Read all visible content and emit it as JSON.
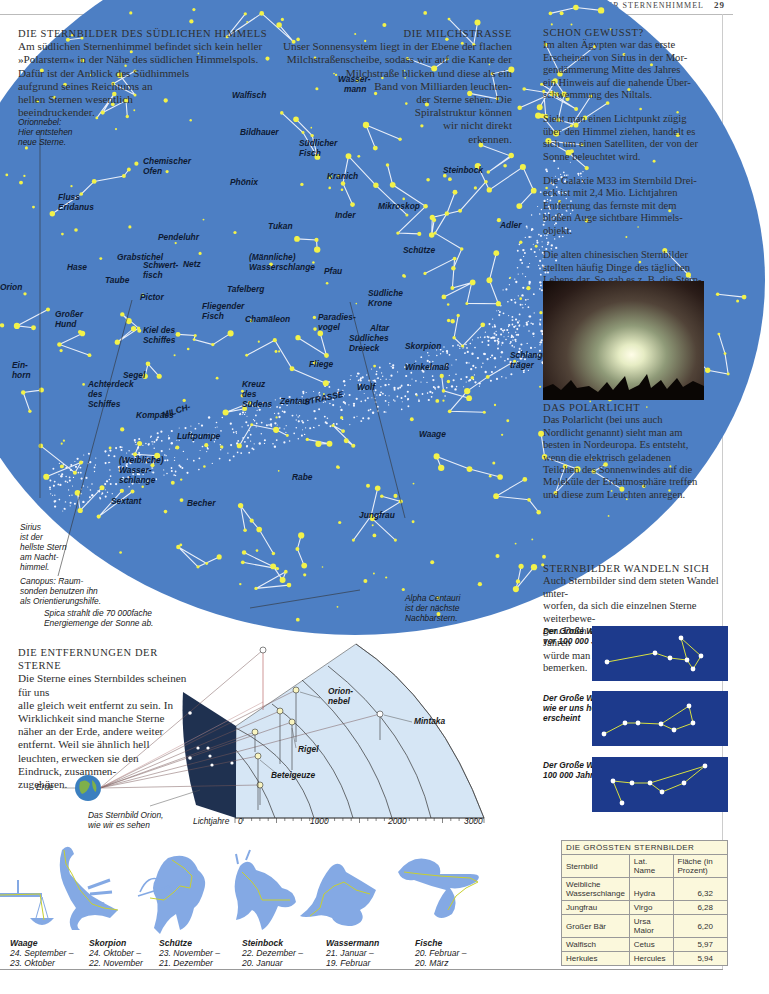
{
  "page_header": {
    "section": "DER STERNENHIMMEL",
    "page_number": "29"
  },
  "southern_sky": {
    "title": "DIE STERNBILDER DES SÜDLICHEN HIMMELS",
    "lines": [
      "Am südlichen Sternenhimmel befindet sich kein heller",
      "»Polarstern« in der Nähe des südlichen Himmelspols.",
      "Dafür ist der Anblick des Südhimmels",
      "aufgrund seines Reichtums an",
      "hellen Sternen wesentlich",
      "beeindruckender."
    ]
  },
  "milky_way": {
    "title": "DIE MILCHSTRASSE",
    "lines": [
      "Unser Sonnensystem liegt in der Ebene der flachen",
      "Milchstraßenscheibe, sodass wir auf die Kante der",
      "Milchstraße blicken und diese als ein",
      "Band von Milliarden leuchten-",
      "der Sterne sehen. Die",
      "Spiralstruktur können",
      "wir nicht direkt",
      "erkennen."
    ]
  },
  "did_you_know": {
    "title": "SCHON GEWUSST?",
    "paragraphs": [
      [
        "Im alten Ägypten war das erste",
        "Erscheinen von Sirius in der Mor-",
        "gendämmerung Mitte des Jahres",
        "ein Hinweis auf die nahende Über-",
        "schwemmung des Niltals."
      ],
      [
        "Sieht man einen Lichtpunkt zügig",
        "über den Himmel ziehen, handelt es",
        "sich um einen Satelliten, der von der",
        "Sonne beleuchtet wird."
      ],
      [
        "Die Galaxie M33 im Sternbild Drei-",
        "eck ist mit 2,4 Mio. Lichtjahren",
        "Entfernung das fernste mit dem",
        "bloßen Auge sichtbare Himmels-",
        "objekt."
      ],
      [
        "Die alten chinesischen Sternbilder",
        "stellten häufig Dinge des täglichen",
        "Lebens dar. So gab es z. B. die Stern-",
        "bilder »Gefängnis« und »Stall«."
      ]
    ]
  },
  "aurora": {
    "title": "DAS POLARLICHT",
    "lines": [
      "Das Polarlicht (bei uns auch",
      "Nordlicht genannt) sieht man am",
      "besten in Nordeuropa. Es entsteht,",
      "wenn die elektrisch geladenen",
      "Teilchen des Sonnenwindes auf die",
      "Moleküle der Erdatmosphäre treffen",
      "und diese zum Leuchten anregen."
    ]
  },
  "sky_captions": {
    "orion_nebula": [
      "Orionnebel:",
      "Hier entstehen",
      "neue Sterne."
    ],
    "sirius": [
      "Sirius",
      "ist der",
      "hellste Stern",
      "am Nacht-",
      "himmel."
    ],
    "canopus": [
      "Canopus: Raum-",
      "sonden benutzen ihn",
      "als Orientierungshilfe."
    ],
    "spica": [
      "Spica strahlt die 70 000fache",
      "Energiemenge der Sonne ab."
    ],
    "alpha_centauri": [
      "Alpha Centauri",
      "ist der nächste",
      "Nachbarstern."
    ]
  },
  "constellations": [
    {
      "name": "Walfisch",
      "x": 292,
      "y": 208
    },
    {
      "name": "Wasser-",
      "x": 398,
      "y": 192
    },
    {
      "name": "mann",
      "x": 404,
      "y": 202
    },
    {
      "name": "Bildhauer",
      "x": 300,
      "y": 245
    },
    {
      "name": "Südlicher",
      "x": 359,
      "y": 256
    },
    {
      "name": "Fisch",
      "x": 359,
      "y": 266
    },
    {
      "name": "Chemischer",
      "x": 203,
      "y": 274
    },
    {
      "name": "Ofen",
      "x": 203,
      "y": 284
    },
    {
      "name": "Phönix",
      "x": 290,
      "y": 295
    },
    {
      "name": "Kranich",
      "x": 387,
      "y": 289
    },
    {
      "name": "Steinbock",
      "x": 503,
      "y": 283
    },
    {
      "name": "Fluss",
      "x": 118,
      "y": 310
    },
    {
      "name": "Eridanus",
      "x": 118,
      "y": 320
    },
    {
      "name": "Mikroskop",
      "x": 438,
      "y": 319
    },
    {
      "name": "Inder",
      "x": 395,
      "y": 328
    },
    {
      "name": "Tukan",
      "x": 328,
      "y": 339
    },
    {
      "name": "Adler",
      "x": 560,
      "y": 338
    },
    {
      "name": "Pendeluhr",
      "x": 218,
      "y": 350
    },
    {
      "name": "(Männliche)",
      "x": 309,
      "y": 370
    },
    {
      "name": "Wasserschlange",
      "x": 309,
      "y": 380
    },
    {
      "name": "Schütze",
      "x": 463,
      "y": 363
    },
    {
      "name": "Grabstichel",
      "x": 177,
      "y": 370
    },
    {
      "name": "Netz",
      "x": 243,
      "y": 377
    },
    {
      "name": "Pfau",
      "x": 384,
      "y": 384
    },
    {
      "name": "Schwert-",
      "x": 203,
      "y": 378
    },
    {
      "name": "fisch",
      "x": 203,
      "y": 388
    },
    {
      "name": "Hase",
      "x": 127,
      "y": 380
    },
    {
      "name": "Taube",
      "x": 165,
      "y": 393
    },
    {
      "name": "Südliche",
      "x": 428,
      "y": 406
    },
    {
      "name": "Krone",
      "x": 428,
      "y": 416
    },
    {
      "name": "Tafelberg",
      "x": 287,
      "y": 402
    },
    {
      "name": "Orion",
      "x": 60,
      "y": 400
    },
    {
      "name": "Pictor",
      "x": 200,
      "y": 410
    },
    {
      "name": "Fliegender",
      "x": 262,
      "y": 419
    },
    {
      "name": "Fisch",
      "x": 262,
      "y": 429
    },
    {
      "name": "Chamäleon",
      "x": 305,
      "y": 432
    },
    {
      "name": "Paradies-",
      "x": 378,
      "y": 430
    },
    {
      "name": "vogel",
      "x": 378,
      "y": 440
    },
    {
      "name": "Altar",
      "x": 430,
      "y": 441
    },
    {
      "name": "Großer",
      "x": 115,
      "y": 427
    },
    {
      "name": "Hund",
      "x": 115,
      "y": 437
    },
    {
      "name": "Südliches",
      "x": 409,
      "y": 451
    },
    {
      "name": "Dreieck",
      "x": 409,
      "y": 461
    },
    {
      "name": "Skorpion",
      "x": 465,
      "y": 459
    },
    {
      "name": "Schlangen-",
      "x": 570,
      "y": 468
    },
    {
      "name": "träger",
      "x": 570,
      "y": 478
    },
    {
      "name": "Kiel des",
      "x": 203,
      "y": 443
    },
    {
      "name": "Schiffes",
      "x": 203,
      "y": 453
    },
    {
      "name": "Ein-",
      "x": 72,
      "y": 478
    },
    {
      "name": "horn",
      "x": 72,
      "y": 488
    },
    {
      "name": "Fliege",
      "x": 369,
      "y": 477
    },
    {
      "name": "Winkelmaß",
      "x": 465,
      "y": 480
    },
    {
      "name": "Segel",
      "x": 183,
      "y": 488
    },
    {
      "name": "Achterdeck",
      "x": 148,
      "y": 497
    },
    {
      "name": "des",
      "x": 148,
      "y": 507
    },
    {
      "name": "Schiffes",
      "x": 148,
      "y": 517
    },
    {
      "name": "Kreuz",
      "x": 302,
      "y": 497
    },
    {
      "name": "des",
      "x": 302,
      "y": 507
    },
    {
      "name": "Südens",
      "x": 302,
      "y": 517
    },
    {
      "name": "Wolf",
      "x": 417,
      "y": 500
    },
    {
      "name": "Zentaur",
      "x": 340,
      "y": 514
    },
    {
      "name": "Kompass",
      "x": 196,
      "y": 528
    },
    {
      "name": "Luftpumpe",
      "x": 237,
      "y": 549
    },
    {
      "name": "Waage",
      "x": 479,
      "y": 547
    },
    {
      "name": "(Weibliche)",
      "x": 179,
      "y": 573
    },
    {
      "name": "Wasser-",
      "x": 179,
      "y": 583
    },
    {
      "name": "schlange",
      "x": 179,
      "y": 593
    },
    {
      "name": "Rabe",
      "x": 352,
      "y": 590
    },
    {
      "name": "Sextant",
      "x": 171,
      "y": 614
    },
    {
      "name": "Becher",
      "x": 247,
      "y": 616
    },
    {
      "name": "Jungfrau",
      "x": 419,
      "y": 628
    }
  ],
  "milky_way_band_labels": {
    "left": "MILCH-",
    "right": "STRASSE"
  },
  "distances": {
    "title": "DIE ENTFERNUNGEN DER STERNE",
    "lines": [
      "Die Sterne eines Sternbildes scheinen für uns",
      "alle gleich weit entfernt zu sein. In",
      "Wirklichkeit sind manche Sterne",
      "näher an der Erde, andere weiter",
      "entfernt. Weil sie ähnlich hell",
      "leuchten, erwecken sie den",
      "Eindruck, zusammen-",
      "zugehören."
    ],
    "labels": {
      "earth": "Erde",
      "orion_seen": [
        "Das Sternbild Orion,",
        "wie wir es sehen"
      ],
      "axis": "Lichtjahre",
      "orion_nebula": [
        "Orion-",
        "nebel"
      ],
      "mintaka": "Mintaka",
      "rigel": "Rigel",
      "betelgeuse": "Beteigeuze"
    },
    "axis_ticks": [
      "0",
      "1000",
      "2000",
      "3000"
    ]
  },
  "changing": {
    "title": "STERNBILDER WANDELN SICH",
    "lines": [
      "Auch Sternbilder sind dem steten Wandel unter-",
      "worfen, da sich die einzelnen Sterne weiterbewe-",
      "gen. Doch erst in einigen hunderttausend Jahren",
      "würde man die Änderung ihrer Gestalt bemerken."
    ],
    "panels": [
      {
        "caption": [
          "Der Große Wagen",
          "vor 100 000 Jahren"
        ]
      },
      {
        "caption": [
          "Der Große Wagen,",
          "wie er uns heute",
          "erscheint"
        ]
      },
      {
        "caption": [
          "Der Große Wagen in",
          "100 000 Jahren"
        ]
      }
    ]
  },
  "zodiac": [
    {
      "name": "Waage",
      "from": "24. September –",
      "to": "23. Oktober"
    },
    {
      "name": "Skorpion",
      "from": "24. Oktober –",
      "to": "22. November"
    },
    {
      "name": "Schütze",
      "from": "23. November –",
      "to": "21. Dezember"
    },
    {
      "name": "Steinbock",
      "from": "22. Dezember –",
      "to": "20. Januar"
    },
    {
      "name": "Wassermann",
      "from": "21. Januar –",
      "to": "19. Februar"
    },
    {
      "name": "Fische",
      "from": "20. Februar –",
      "to": "20. März"
    }
  ],
  "largest_table": {
    "title": "DIE GRÖSSTEN STERNBILDER",
    "headers": [
      "Sternbild",
      "Lat. Name",
      "Fläche (in Prozent)"
    ],
    "rows": [
      [
        "Weibliche Wasserschlange",
        "Hydra",
        "6,32"
      ],
      [
        "Jungfrau",
        "Virgo",
        "6,28"
      ],
      [
        "Großer Bär",
        "Ursa Maior",
        "6,20"
      ],
      [
        "Walfisch",
        "Cetus",
        "5,97"
      ],
      [
        "Herkules",
        "Hercules",
        "5,94"
      ]
    ]
  },
  "colors": {
    "sky": "#4d7fc4",
    "star": "#f2f24a",
    "dipper_bg": "#1d3a8c",
    "table_bg": "#fbf8dc",
    "diagram_bg": "#d6e6f5"
  }
}
